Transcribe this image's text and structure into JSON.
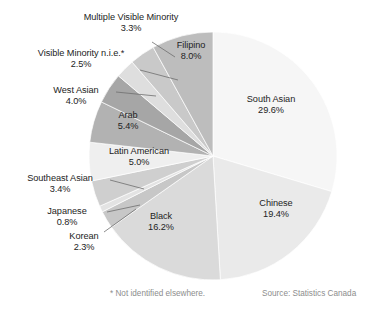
{
  "chart_data": {
    "type": "pie",
    "title": "",
    "subtitle": "",
    "xlabel": "",
    "ylabel": "",
    "legend_position": "none",
    "grid": false,
    "units": "percent",
    "categories": [
      "South Asian",
      "Chinese",
      "Black",
      "Filipino",
      "Arab",
      "Latin American",
      "Southeast Asian",
      "West Asian",
      "Multiple Visible Minority",
      "Korean",
      "Visible Minority n.i.e.*",
      "Japanese"
    ],
    "values": [
      29.6,
      19.4,
      16.2,
      8.0,
      5.4,
      5.0,
      3.4,
      4.0,
      3.3,
      2.3,
      2.5,
      0.8
    ],
    "slices": [
      {
        "label": "South Asian",
        "value": 29.6,
        "value_text": "29.6%",
        "color": "#f6f6f6",
        "label_placement": "inside"
      },
      {
        "label": "Chinese",
        "value": 19.4,
        "value_text": "19.4%",
        "color": "#eaeaea",
        "label_placement": "inside"
      },
      {
        "label": "Black",
        "value": 16.2,
        "value_text": "16.2%",
        "color": "#dadada",
        "label_placement": "inside"
      },
      {
        "label": "Korean",
        "value": 2.3,
        "value_text": "2.3%",
        "color": "#c7c7c7",
        "label_placement": "outside"
      },
      {
        "label": "Japanese",
        "value": 0.8,
        "value_text": "0.8%",
        "color": "#e3e3e3",
        "label_placement": "outside"
      },
      {
        "label": "Southeast Asian",
        "value": 3.4,
        "value_text": "3.4%",
        "color": "#cfcfcf",
        "label_placement": "outside"
      },
      {
        "label": "Latin American",
        "value": 5.0,
        "value_text": "5.0%",
        "color": "#efefef",
        "label_placement": "inside"
      },
      {
        "label": "Arab",
        "value": 5.4,
        "value_text": "5.4%",
        "color": "#b2b2b2",
        "label_placement": "inside"
      },
      {
        "label": "West Asian",
        "value": 4.0,
        "value_text": "4.0%",
        "color": "#a6a6a6",
        "label_placement": "outside"
      },
      {
        "label": "Visible Minority n.i.e.*",
        "value": 2.5,
        "value_text": "2.5%",
        "color": "#dedede",
        "label_placement": "outside"
      },
      {
        "label": "Multiple Visible Minority",
        "value": 3.3,
        "value_text": "3.3%",
        "color": "#c9c9c9",
        "label_placement": "outside"
      },
      {
        "label": "Filipino",
        "value": 8.0,
        "value_text": "8.0%",
        "color": "#bdbdbd",
        "label_placement": "inside"
      }
    ]
  },
  "labels": {
    "south_asian": {
      "name": "South Asian",
      "pct": "29.6%"
    },
    "chinese": {
      "name": "Chinese",
      "pct": "19.4%"
    },
    "black": {
      "name": "Black",
      "pct": "16.2%"
    },
    "filipino": {
      "name": "Filipino",
      "pct": "8.0%"
    },
    "arab": {
      "name": "Arab",
      "pct": "5.4%"
    },
    "latin_american": {
      "name": "Latin American",
      "pct": "5.0%"
    },
    "west_asian": {
      "name": "West Asian",
      "pct": "4.0%"
    },
    "southeast_asian": {
      "name": "Southeast Asian",
      "pct": "3.4%"
    },
    "multiple_visible_minority": {
      "name": "Multiple Visible Minority",
      "pct": "3.3%"
    },
    "visible_minority_nie": {
      "name": "Visible Minority n.i.e.*",
      "pct": "2.5%"
    },
    "korean": {
      "name": "Korean",
      "pct": "2.3%"
    },
    "japanese": {
      "name": "Japanese",
      "pct": "0.8%"
    }
  },
  "footnotes": {
    "nie": "* Not identified elsewhere.",
    "source": "Source: Statistics Canada"
  },
  "colors": {
    "text": "#232323",
    "muted_text": "#8d8d8d",
    "background": "#ffffff",
    "leader_line": "#6f6f6f"
  }
}
